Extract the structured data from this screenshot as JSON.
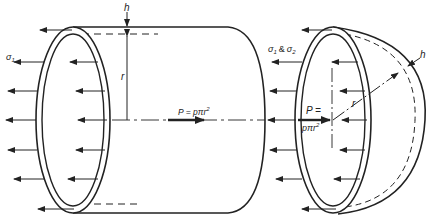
{
  "figure": {
    "cylinder": {
      "thickness_label": "h",
      "radius_label": "r",
      "stress_label": "σ",
      "stress_subscript": "1",
      "force_label": "P = pπr",
      "force_exponent": "2"
    },
    "hemisphere": {
      "thickness_label": "h",
      "radius_label": "r",
      "stress_label_a": "σ",
      "stress_sub_a": "1",
      "stress_amp": "&",
      "stress_label_b": "σ",
      "stress_sub_b": "2",
      "force_label_line1": "P =",
      "force_label_line2": "pπr",
      "force_exponent": "2"
    },
    "colors": {
      "stroke": "#222222",
      "background": "#ffffff"
    }
  }
}
